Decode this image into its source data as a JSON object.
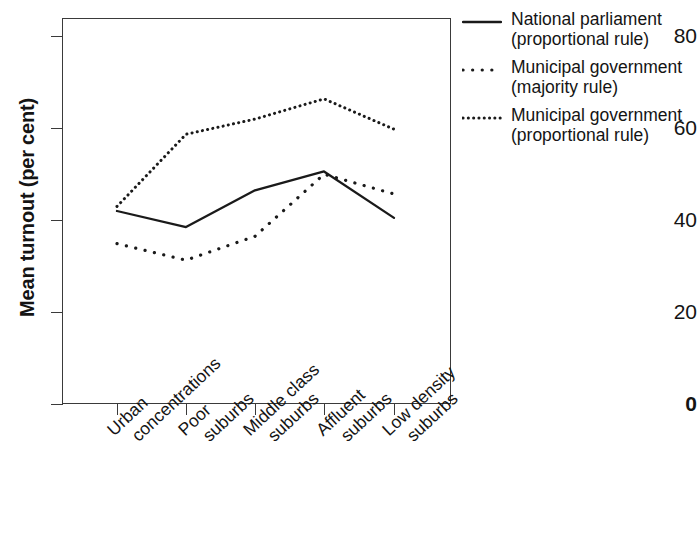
{
  "chart_data": {
    "type": "line",
    "title": "",
    "xlabel": "",
    "ylabel": "Mean turnout (per cent)",
    "categories": [
      "Urban\nconcentrations",
      "Poor\nsuburbs",
      "Middle class\nsuburbs",
      "Affluent\nsuburbs",
      "Low density\nsuburbs"
    ],
    "ylim": [
      0,
      84
    ],
    "yticks": [
      0,
      20,
      40,
      60,
      80
    ],
    "ytick_labels": [
      "0",
      "20",
      "40",
      "60",
      "80"
    ],
    "grid": false,
    "legend_position": "right-top",
    "series": [
      {
        "name": "National parliament\n(proportional rule)",
        "style": "solid",
        "color": "#1a1a1a",
        "values": [
          42.0,
          38.5,
          46.5,
          50.6,
          40.5
        ]
      },
      {
        "name": "Municipal government\n(majority rule)",
        "style": "sparse-dotted",
        "color": "#1a1a1a",
        "values": [
          34.9,
          31.3,
          36.5,
          50.0,
          45.7
        ]
      },
      {
        "name": "Municipal government\n(proportional rule)",
        "style": "dense-dotted",
        "color": "#1a1a1a",
        "values": [
          43.0,
          58.7,
          62.0,
          66.4,
          59.8
        ]
      }
    ]
  },
  "legend": {
    "entries": [
      {
        "label": "National parliament\n(proportional rule)",
        "style": "solid"
      },
      {
        "label": "Municipal government\n(majority rule)",
        "style": "sparse-dotted"
      },
      {
        "label": "Municipal government\n(proportional rule)",
        "style": "dense-dotted"
      }
    ]
  }
}
